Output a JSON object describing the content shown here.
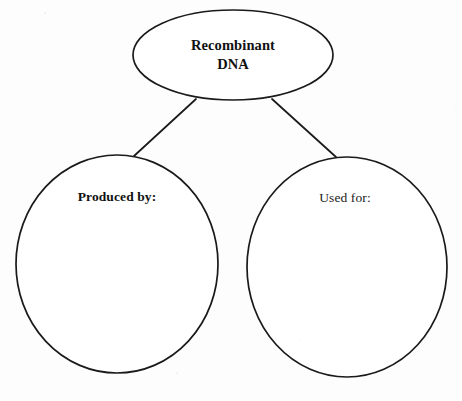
{
  "page": {
    "background_color": "#fdfdfd",
    "ink_color": "#1a1a1a",
    "width": 462,
    "height": 401
  },
  "diagram": {
    "type": "concept-map",
    "layout": "one parent node with two child nodes connected by straight lines",
    "root": {
      "id": "recombinant-dna",
      "shape": "ellipse",
      "label": "Recombinant\nDNA",
      "label_line_1": "Recombinant",
      "label_line_2": "DNA",
      "font_weight": "bold",
      "cx": 233,
      "cy": 55,
      "rx": 100,
      "ry": 45
    },
    "children": [
      {
        "id": "produced-by",
        "shape": "circle",
        "label": "Produced by:",
        "font_weight": "bold",
        "answer_value": "",
        "cx": 117,
        "cy": 264,
        "rx": 101,
        "ry": 109
      },
      {
        "id": "used-for",
        "shape": "circle",
        "label": "Used for:",
        "font_weight": "normal",
        "answer_value": "",
        "cx": 347,
        "cy": 267,
        "rx": 100,
        "ry": 110
      }
    ],
    "connectors": [
      {
        "id": "connector-root-to-produced-by",
        "from": "recombinant-dna",
        "to": "produced-by",
        "x1": 196,
        "y1": 99,
        "x2": 134,
        "y2": 156
      },
      {
        "id": "connector-root-to-used-for",
        "from": "recombinant-dna",
        "to": "used-for",
        "x1": 272,
        "y1": 99,
        "x2": 336,
        "y2": 157
      }
    ]
  },
  "specks": [
    {
      "x": 44,
      "y": 12,
      "size": 2
    },
    {
      "x": 62,
      "y": 14,
      "size": 1
    },
    {
      "x": 70,
      "y": 115,
      "size": 1
    },
    {
      "x": 176,
      "y": 372,
      "size": 2
    },
    {
      "x": 409,
      "y": 63,
      "size": 1
    },
    {
      "x": 455,
      "y": 106,
      "size": 1
    },
    {
      "x": 30,
      "y": 330,
      "size": 1
    },
    {
      "x": 300,
      "y": 340,
      "size": 1
    }
  ]
}
